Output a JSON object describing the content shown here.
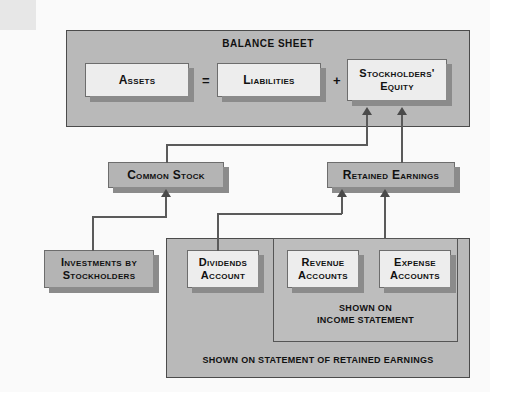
{
  "diagram": {
    "balance_sheet": {
      "title": "BALANCE SHEET",
      "assets": "Assets",
      "equals_operator": "=",
      "liabilities": "Liabilities",
      "plus_operator": "+",
      "stockholders_equity_line1": "Stockholders'",
      "stockholders_equity_line2": "Equity"
    },
    "mid_row": {
      "common_stock": "Common Stock",
      "retained_earnings": "Retained Earnings"
    },
    "bottom_row": {
      "investments_line1": "Investments by",
      "investments_line2": "Stockholders",
      "dividends_line1": "Dividends",
      "dividends_line2": "Account",
      "revenue_line1": "Revenue",
      "revenue_line2": "Accounts",
      "expense_line1": "Expense",
      "expense_line2": "Accounts"
    },
    "captions": {
      "income_statement_line1": "SHOWN ON",
      "income_statement_line2": "INCOME STATEMENT",
      "retained_earnings_panel": "SHOWN ON STATEMENT OF RETAINED EARNINGS"
    },
    "colors": {
      "panel_gray": "#b9b9b9",
      "box_light": "#ededed",
      "box_gray": "#b4b4b4",
      "shadow": "#8b8b8b",
      "line": "#5a5a5a",
      "text": "#111111",
      "page": "#fafafa"
    }
  }
}
